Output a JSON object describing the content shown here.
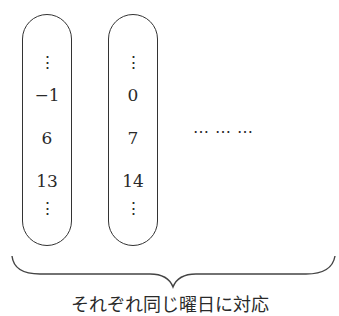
{
  "columns": [
    {
      "top": "⋮",
      "values": [
        "−1",
        "6",
        "13"
      ],
      "bottom": "⋮"
    },
    {
      "top": "⋮",
      "values": [
        "0",
        "7",
        "14"
      ],
      "bottom": "⋮"
    }
  ],
  "continuation": "⋯ ⋯ ⋯",
  "caption": "それぞれ同じ曜日に対応"
}
